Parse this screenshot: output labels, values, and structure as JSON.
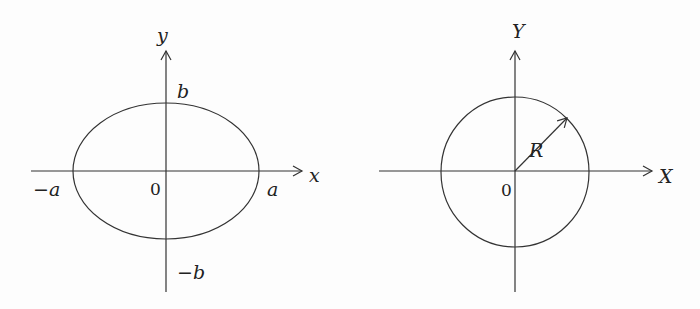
{
  "figures": [
    {
      "name": "ellipse",
      "axes": {
        "x_label": "x",
        "y_label": "y",
        "origin_label": "0"
      },
      "intercepts": {
        "pos_x": "a",
        "neg_x": "−a",
        "pos_y": "b",
        "neg_y": "−b"
      }
    },
    {
      "name": "circle",
      "axes": {
        "x_label": "X",
        "y_label": "Y",
        "origin_label": "0"
      },
      "radius_label": "R"
    }
  ],
  "colors": {
    "stroke": "#333333",
    "text": "#222222"
  }
}
